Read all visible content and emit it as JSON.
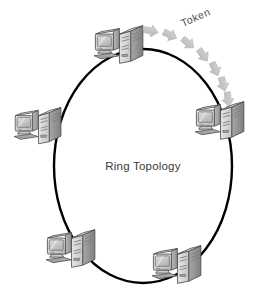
{
  "diagram": {
    "title": "Ring Topology",
    "center_label": "Ring Topology",
    "token_label": "Token",
    "background_color": "#ffffff",
    "ring": {
      "shape": "ellipse",
      "stroke_color": "#000000",
      "stroke_width": 2.4,
      "center_x": 143,
      "center_y": 166,
      "radius_x": 89,
      "radius_y": 117
    },
    "token_flow": {
      "direction": "clockwise",
      "arrow_color": "#c2c2c2",
      "arrow_shadow_color": "#d8d8d8",
      "arrow_count": 8,
      "from_node": "node-top",
      "to_node": "node-right"
    },
    "nodes": [
      {
        "id": "node-top",
        "label": "workstation",
        "x": 92,
        "y": 22,
        "position": "top"
      },
      {
        "id": "node-left",
        "label": "workstation",
        "x": 12,
        "y": 104,
        "position": "left"
      },
      {
        "id": "node-right",
        "label": "workstation",
        "x": 193,
        "y": 98,
        "position": "right"
      },
      {
        "id": "node-bottom-left",
        "label": "workstation",
        "x": 44,
        "y": 226,
        "position": "bottom-left"
      },
      {
        "id": "node-bottom-right",
        "label": "workstation",
        "x": 150,
        "y": 242,
        "position": "bottom-right"
      }
    ],
    "node_parts": [
      "crt-monitor",
      "keyboard",
      "tower-case",
      "network-cable"
    ],
    "colors": {
      "case_light": "#e3e3e3",
      "case_mid": "#bfbfbf",
      "case_dark": "#8f8f8f",
      "outline": "#4a4a4a",
      "screen": "#cfcfcf",
      "cable": "#111111"
    }
  }
}
